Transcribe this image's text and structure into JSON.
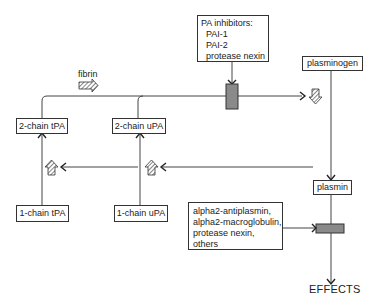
{
  "diagram": {
    "pa_inhibitors": {
      "title": "PA inhibitors:",
      "items": [
        "PAI-1",
        "PAI-2",
        "protease nexin"
      ]
    },
    "fibrin_label": "fibrin",
    "plasminogen_label": "plasminogen",
    "plasmin_label": "plasmin",
    "two_chain_tpa_label": "2-chain tPA",
    "two_chain_upa_label": "2-chain uPA",
    "one_chain_tpa_label": "1-chain tPA",
    "one_chain_upa_label": "1-chain uPA",
    "plasmin_inhibitors": {
      "items": [
        "alpha2-antiplasmin,",
        "alpha2-macroglobulin,",
        "protease nexin,",
        "others"
      ]
    },
    "effects_label": "EFFECTS",
    "colors": {
      "line": "#444444",
      "inhibitor_bar": "#8a8a8a",
      "box_border": "#333333"
    }
  }
}
